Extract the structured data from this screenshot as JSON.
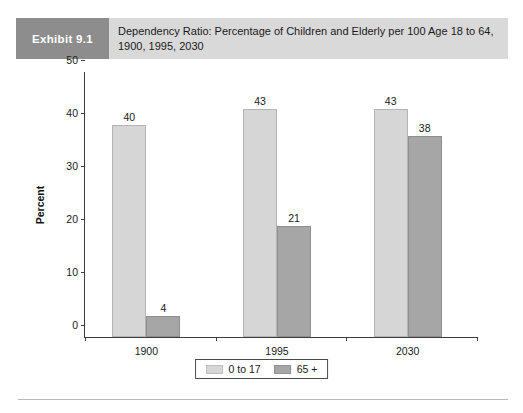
{
  "exhibit": {
    "tag": "Exhibit 9.1",
    "title": "Dependency Ratio: Percentage of Children and Elderly per 100 Age 18 to 64, 1900, 1995, 2030"
  },
  "colors": {
    "tag_background": "#8d8d8d",
    "title_background": "#d9d9d9",
    "series_0": "#d6d6d6",
    "series_1": "#a6a6a6",
    "axis": "#3c3c3c"
  },
  "chart_data": {
    "type": "bar",
    "title": "Dependency Ratio: Percentage of Children and Elderly per 100 Age 18 to 64, 1900, 1995, 2030",
    "categories": [
      "1900",
      "1995",
      "2030"
    ],
    "series": [
      {
        "name": "0 to 17",
        "values": [
          40,
          43,
          43
        ],
        "color": "#d6d6d6"
      },
      {
        "name": "65 +",
        "values": [
          4,
          21,
          38
        ],
        "color": "#a6a6a6"
      }
    ],
    "xlabel": "",
    "ylabel": "Percent",
    "ylim": [
      0,
      50
    ],
    "yticks": [
      0,
      10,
      20,
      30,
      40,
      50
    ],
    "grid": false,
    "legend_position": "bottom",
    "data_labels": true
  }
}
